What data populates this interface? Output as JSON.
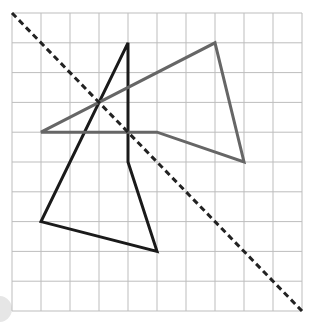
{
  "diagram": {
    "type": "grid-reflection",
    "grid": {
      "columns": 10,
      "rows": 10,
      "origin_px": [
        12,
        13
      ],
      "cell_px": [
        29,
        29.8
      ],
      "line_color": "#bdbdbd"
    },
    "mirror_line": {
      "style": "dashed",
      "color": "#222222",
      "from": [
        0,
        0
      ],
      "to": [
        10,
        10
      ]
    },
    "shapes": [
      {
        "name": "black-quadrilateral",
        "color": "#1a1a1a",
        "points": [
          [
            4,
            1
          ],
          [
            4,
            5
          ],
          [
            5,
            8
          ],
          [
            1,
            7
          ]
        ]
      },
      {
        "name": "gray-quadrilateral",
        "color": "#666666",
        "points": [
          [
            1,
            4
          ],
          [
            7,
            1
          ],
          [
            8,
            5
          ],
          [
            5,
            4
          ]
        ]
      }
    ]
  }
}
